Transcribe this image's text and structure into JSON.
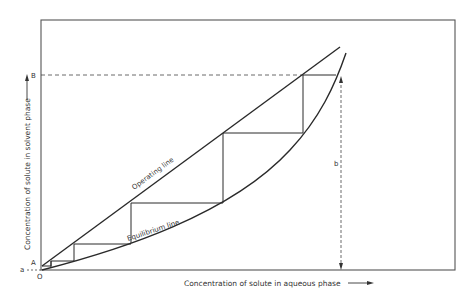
{
  "diagram": {
    "title": "",
    "type": "extraction stage construction (McCabe-Thiele style staircase)",
    "axes": {
      "xlabel": "Concentration of solute in aqueous phase",
      "ylabel": "Concentration of solute in solvent phase",
      "x_arrow": "→",
      "y_arrow": "→"
    },
    "lines": {
      "operating": "Operating line",
      "equilibrium": "Equilibrium line"
    },
    "points": {
      "origin": "O",
      "A": "A",
      "B": "B",
      "a": "a",
      "b": "b"
    },
    "stages_count": 5,
    "colors": {
      "line": "#2a2a2a",
      "frame": "#555555",
      "text": "#333333",
      "background": "#ffffff"
    }
  }
}
